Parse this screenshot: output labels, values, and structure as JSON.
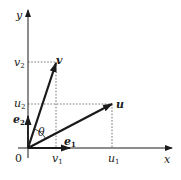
{
  "diagram": {
    "axes": {
      "x_label": "x",
      "y_label": "y",
      "origin_label": "0"
    },
    "vectors": {
      "u": {
        "label": "u",
        "components": {
          "x_label": "u",
          "x_sub": "1",
          "y_label": "u",
          "y_sub": "2"
        }
      },
      "v": {
        "label": "v",
        "components": {
          "x_label": "v",
          "x_sub": "1",
          "y_label": "v",
          "y_sub": "2"
        }
      },
      "e1": {
        "label": "e",
        "sub": "1"
      },
      "e2": {
        "label": "e",
        "sub": "2"
      }
    },
    "angle_label": "θ",
    "colors": {
      "stroke": "#1a1a1a",
      "dashed": "#555555",
      "background": "#ffffff"
    }
  }
}
